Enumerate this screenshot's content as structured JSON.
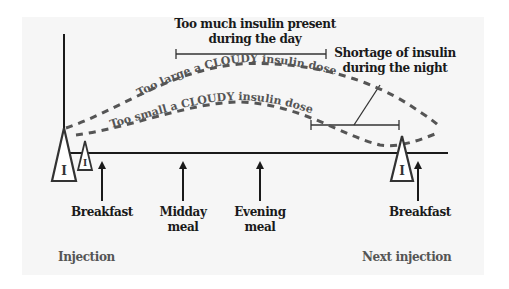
{
  "diagram": {
    "colors": {
      "background": "#ffffff",
      "panel": "#f6f6f6",
      "axis": "#1a1a1a",
      "curve": "#555555",
      "footer_text": "#555555"
    },
    "annotations": {
      "too_much_line1": "Too much insulin present",
      "too_much_line2": "during the day",
      "shortage_line1": "Shortage of insulin",
      "shortage_line2": "during the night"
    },
    "curves": {
      "large_dose": "Too large a CLOUDY insulin dose",
      "small_dose": "Too small a CLOUDY insulin dose"
    },
    "injection_marker": "I",
    "meals": [
      {
        "line1": "Breakfast",
        "line2": ""
      },
      {
        "line1": "Midday",
        "line2": "meal"
      },
      {
        "line1": "Evening",
        "line2": "meal"
      },
      {
        "line1": "Breakfast",
        "line2": ""
      }
    ],
    "footer": {
      "left": "Injection",
      "right": "Next injection"
    }
  }
}
